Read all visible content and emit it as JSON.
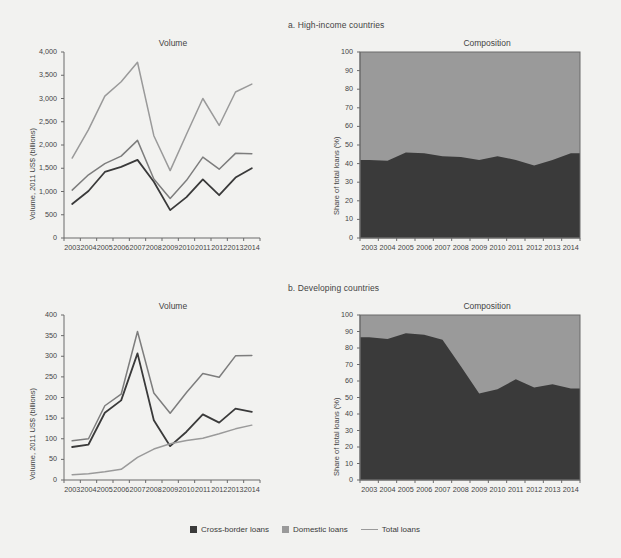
{
  "figure": {
    "background": "#f2f2f0",
    "panels": [
      {
        "id": "a",
        "title": "a. High-income countries"
      },
      {
        "id": "b",
        "title": "b. Developing countries"
      }
    ]
  },
  "legend": {
    "items": [
      {
        "label": "Cross-border loans",
        "type": "swatch",
        "color": "#3a3a3a"
      },
      {
        "label": "Domestic loans",
        "type": "swatch",
        "color": "#9a9a9a"
      },
      {
        "label": "Total loans",
        "type": "line",
        "color": "#9a9a9a"
      }
    ]
  },
  "colors": {
    "cross_border": "#3a3a3a",
    "domestic": "#9a9a9a",
    "total_line": "#9a9a9a",
    "mid_line": "#7d7d7d",
    "axis": "#6a6a6a",
    "text": "#444444"
  },
  "chart_data": [
    {
      "id": "a-volume",
      "type": "line",
      "panel": "a. High-income countries",
      "title": "Volume",
      "xlabel": "",
      "ylabel": "Volume, 2011 US$ (billions)",
      "categories": [
        "2003",
        "2004",
        "2005",
        "2006",
        "2007",
        "2008",
        "2009",
        "2010",
        "2011",
        "2012",
        "2013",
        "2014"
      ],
      "yticks": [
        "0",
        "500",
        "1,000",
        "1,500",
        "2,000",
        "2,500",
        "3,000",
        "3,500",
        "4,000"
      ],
      "ylim": [
        0,
        4000
      ],
      "grid": false,
      "legend_position": "bottom-figure",
      "series": [
        {
          "name": "Cross-border loans",
          "color": "#3a3a3a",
          "values": [
            730,
            1010,
            1420,
            1530,
            1680,
            1210,
            600,
            880,
            1260,
            920,
            1300,
            1500
          ]
        },
        {
          "name": "Domestic loans",
          "color": "#7d7d7d",
          "values": [
            1030,
            1360,
            1600,
            1760,
            2100,
            1270,
            850,
            1240,
            1740,
            1480,
            1820,
            1810
          ]
        },
        {
          "name": "Total loans",
          "color": "#9a9a9a",
          "values": [
            1720,
            2330,
            3050,
            3360,
            3780,
            2200,
            1450,
            2230,
            3000,
            2420,
            3140,
            3310
          ]
        }
      ]
    },
    {
      "id": "a-composition",
      "type": "area",
      "panel": "a. High-income countries",
      "title": "Composition",
      "xlabel": "",
      "ylabel": "Share of total loans (%)",
      "categories": [
        "2003",
        "2004",
        "2005",
        "2006",
        "2007",
        "2008",
        "2009",
        "2010",
        "2011",
        "2012",
        "2013",
        "2014"
      ],
      "yticks": [
        "0",
        "10",
        "20",
        "30",
        "40",
        "50",
        "60",
        "70",
        "80",
        "90",
        "100"
      ],
      "ylim": [
        0,
        100
      ],
      "grid": false,
      "series": [
        {
          "name": "Cross-border loans",
          "color": "#3a3a3a",
          "values": [
            42,
            41.5,
            46,
            45.5,
            44,
            43.5,
            42,
            44,
            42,
            39,
            42,
            45.5
          ]
        },
        {
          "name": "Domestic loans",
          "color": "#9a9a9a",
          "values": [
            58,
            58.5,
            54,
            54.5,
            56,
            56.5,
            58,
            56,
            58,
            61,
            58,
            54.5
          ]
        }
      ]
    },
    {
      "id": "b-volume",
      "type": "line",
      "panel": "b. Developing countries",
      "title": "Volume",
      "xlabel": "",
      "ylabel": "Volume, 2011 US$ (billions)",
      "categories": [
        "2003",
        "2004",
        "2005",
        "2006",
        "2007",
        "2008",
        "2009",
        "2010",
        "2011",
        "2012",
        "2013",
        "2014"
      ],
      "yticks": [
        "0",
        "50",
        "100",
        "150",
        "200",
        "250",
        "300",
        "350",
        "400"
      ],
      "ylim": [
        0,
        400
      ],
      "grid": false,
      "series": [
        {
          "name": "Cross-border loans",
          "color": "#3a3a3a",
          "values": [
            80,
            86,
            163,
            193,
            307,
            145,
            82,
            117,
            159,
            139,
            173,
            165
          ]
        },
        {
          "name": "Domestic loans",
          "color": "#9a9a9a",
          "values": [
            13,
            15,
            20,
            26,
            55,
            75,
            88,
            96,
            101,
            112,
            124,
            133
          ]
        },
        {
          "name": "Total loans",
          "color": "#7d7d7d",
          "values": [
            95,
            100,
            180,
            208,
            360,
            211,
            162,
            212,
            258,
            249,
            301,
            302
          ]
        }
      ]
    },
    {
      "id": "b-composition",
      "type": "area",
      "panel": "b. Developing countries",
      "title": "Composition",
      "xlabel": "",
      "ylabel": "Share of total loans (%)",
      "categories": [
        "2003",
        "2004",
        "2005",
        "2006",
        "2007",
        "2008",
        "2009",
        "2010",
        "2011",
        "2012",
        "2013",
        "2014"
      ],
      "yticks": [
        "0",
        "10",
        "20",
        "30",
        "40",
        "50",
        "60",
        "70",
        "80",
        "90",
        "100"
      ],
      "ylim": [
        0,
        100
      ],
      "grid": false,
      "series": [
        {
          "name": "Cross-border loans",
          "color": "#3a3a3a",
          "values": [
            86.5,
            85.5,
            89,
            88,
            85,
            69,
            52.5,
            55,
            61,
            56,
            58,
            55.5
          ]
        },
        {
          "name": "Domestic loans",
          "color": "#9a9a9a",
          "values": [
            13.5,
            14.5,
            11,
            12,
            15,
            31,
            47.5,
            45,
            39,
            44,
            42,
            44.5
          ]
        }
      ]
    }
  ]
}
